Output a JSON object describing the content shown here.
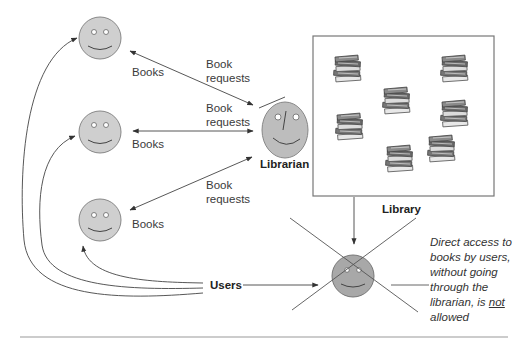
{
  "labels": {
    "books_1": "Books",
    "books_2": "Books",
    "books_3": "Books",
    "request_1_line1": "Book",
    "request_1_line2": "requests",
    "request_2_line1": "Book",
    "request_2_line2": "requests",
    "request_3_line1": "Book",
    "request_3_line2": "requests",
    "librarian": "Librarian",
    "library": "Library",
    "users": "Users"
  },
  "note": {
    "line1": "Direct access to",
    "line2": "books by users,",
    "line3": "without going",
    "line4": "through the",
    "line5_pre": "librarian, is ",
    "line5_emph": "not",
    "line6": "allowed"
  },
  "nodes": {
    "users": [
      {
        "id": "user-1",
        "cx": 100,
        "cy": 38
      },
      {
        "id": "user-2",
        "cx": 100,
        "cy": 132
      },
      {
        "id": "user-3",
        "cx": 100,
        "cy": 220
      }
    ],
    "librarian": {
      "cx": 285,
      "cy": 130
    },
    "blocked_user": {
      "cx": 353,
      "cy": 276
    },
    "library_box": {
      "x": 313,
      "y": 36,
      "w": 181,
      "h": 160
    },
    "book_stacks": [
      {
        "x": 348,
        "y": 68
      },
      {
        "x": 455,
        "y": 68
      },
      {
        "x": 397,
        "y": 100
      },
      {
        "x": 455,
        "y": 113
      },
      {
        "x": 350,
        "y": 126
      },
      {
        "x": 442,
        "y": 148
      },
      {
        "x": 400,
        "y": 158
      }
    ]
  },
  "colors": {
    "face_fill": "#cfcfcf",
    "face_stroke": "#888888",
    "librarian_fill": "#bdbdbd",
    "blocked_fill": "#a8a8a8",
    "line": "#444444"
  }
}
